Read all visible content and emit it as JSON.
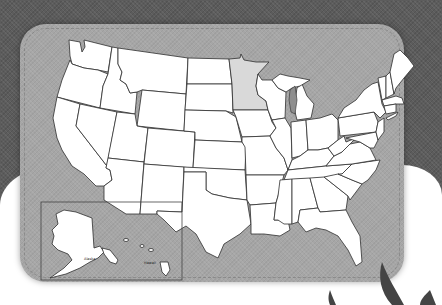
{
  "map": {
    "title": "United States blank map",
    "highlighted_state": "Minnesota",
    "highlight_color": "#d9d9d9",
    "state_fill": "#ffffff",
    "panel_color": "#a6a6a6",
    "background_color": "#5c5c5c",
    "inset": {
      "labels": {
        "alaska": "Alaska",
        "hawaii": "Hawaii"
      }
    }
  }
}
